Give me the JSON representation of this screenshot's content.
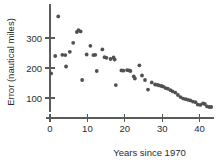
{
  "chart_data": {
    "type": "scatter",
    "title": "",
    "xlabel": "Years since 1970",
    "ylabel": "Error (nautical miles)",
    "xlim": [
      -1.5,
      44
    ],
    "ylim": [
      40,
      400
    ],
    "xticks": [
      0,
      10,
      20,
      30,
      40
    ],
    "xticklabels": [
      "0",
      "10",
      "20",
      "30",
      "40"
    ],
    "yticks": [
      100,
      200,
      300
    ],
    "yticklabels": [
      "100",
      "200",
      "300"
    ],
    "grid": false,
    "legend": null,
    "marker_color": "#515151",
    "axis_color": "#5a5a5a",
    "points": [
      [
        0.3,
        182
      ],
      [
        1.4,
        240
      ],
      [
        2.2,
        372
      ],
      [
        3.3,
        244
      ],
      [
        4.1,
        243
      ],
      [
        4.3,
        205
      ],
      [
        5.3,
        254
      ],
      [
        6.2,
        284
      ],
      [
        7.2,
        320
      ],
      [
        7.6,
        326
      ],
      [
        8.2,
        322
      ],
      [
        8.6,
        160
      ],
      [
        9.8,
        245
      ],
      [
        10.8,
        274
      ],
      [
        11.6,
        243
      ],
      [
        12.1,
        244
      ],
      [
        12.5,
        190
      ],
      [
        14.0,
        262
      ],
      [
        14.6,
        236
      ],
      [
        15.1,
        234
      ],
      [
        16.2,
        230
      ],
      [
        17.0,
        235
      ],
      [
        17.3,
        228
      ],
      [
        17.6,
        143
      ],
      [
        19.1,
        192
      ],
      [
        19.6,
        191
      ],
      [
        20.6,
        193
      ],
      [
        21.1,
        192
      ],
      [
        21.5,
        190
      ],
      [
        22.4,
        172
      ],
      [
        22.7,
        165
      ],
      [
        23.9,
        209
      ],
      [
        24.6,
        175
      ],
      [
        25.4,
        160
      ],
      [
        26.2,
        128
      ],
      [
        27.2,
        152
      ],
      [
        28.1,
        145
      ],
      [
        28.7,
        144
      ],
      [
        29.2,
        142
      ],
      [
        29.8,
        140
      ],
      [
        30.3,
        138
      ],
      [
        30.9,
        133
      ],
      [
        31.5,
        131
      ],
      [
        32.2,
        126
      ],
      [
        32.8,
        122
      ],
      [
        33.5,
        118
      ],
      [
        34.2,
        110
      ],
      [
        34.9,
        103
      ],
      [
        35.6,
        98
      ],
      [
        36.3,
        96
      ],
      [
        36.9,
        94
      ],
      [
        37.5,
        92
      ],
      [
        38.2,
        88
      ],
      [
        38.9,
        86
      ],
      [
        39.5,
        78
      ],
      [
        40.2,
        77
      ],
      [
        40.9,
        82
      ],
      [
        41.4,
        80
      ],
      [
        42.0,
        72
      ],
      [
        42.6,
        70
      ],
      [
        43.1,
        70
      ]
    ]
  }
}
